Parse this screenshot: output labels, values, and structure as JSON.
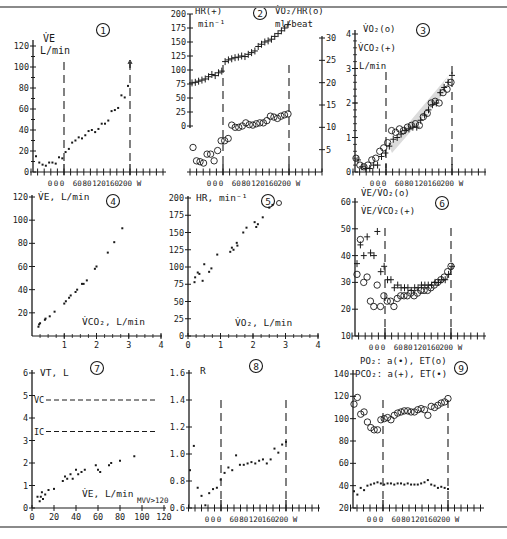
{
  "figure": {
    "caption_cropped": "Figure ... exercise test",
    "panel_count": 9
  },
  "chart_data": [
    {
      "id": 1,
      "type": "scatter",
      "title": "①",
      "ylabel": "V̇E",
      "yunit": "L/min",
      "xlabel": "W",
      "ylim": [
        0,
        120
      ],
      "yticks": [
        0,
        20,
        40,
        60,
        80,
        100,
        120
      ],
      "xtick_labels": [
        "0",
        "0",
        "0",
        "60",
        "80",
        "120",
        "160",
        "200",
        "W"
      ],
      "vlines": [
        "start_exercise",
        "end_exercise"
      ],
      "series": [
        {
          "name": "VE",
          "marker": "dot",
          "values": [
            15,
            9,
            7,
            6,
            9,
            9,
            8,
            14,
            13,
            19,
            22,
            28,
            30,
            33,
            32,
            35,
            39,
            40,
            38,
            41,
            46,
            46,
            49,
            58,
            59,
            61,
            73,
            71,
            82
          ]
        }
      ]
    },
    {
      "id": 2,
      "type": "scatter",
      "title": "②",
      "ylabel_left": "HR(+)",
      "yunit_left": "min⁻¹",
      "ylabel_right": "V̇O₂/HR(o)",
      "yunit_right": "ml/beat",
      "ylim_left": [
        0,
        200
      ],
      "yticks_left": [
        0,
        25,
        50,
        75,
        100,
        125,
        150,
        175,
        200
      ],
      "ylim_right": [
        0,
        30
      ],
      "yticks_right": [
        5,
        10,
        15,
        20,
        25,
        30
      ],
      "xtick_labels": [
        "0",
        "0",
        "0",
        "60",
        "80",
        "120",
        "160",
        "200",
        "W"
      ],
      "series": [
        {
          "name": "HR",
          "marker": "+",
          "values": [
            77,
            78,
            80,
            82,
            84,
            88,
            92,
            90,
            95,
            98,
            115,
            118,
            120,
            122,
            123,
            125,
            124,
            128,
            131,
            134,
            142,
            146,
            150,
            152,
            155,
            160,
            165,
            170,
            175,
            181
          ]
        },
        {
          "name": "VO2/HR",
          "marker": "o",
          "values": [
            5.5,
            2.5,
            2.3,
            2,
            4,
            4,
            2.5,
            4.8,
            7,
            7,
            7.5,
            10.5,
            10,
            10,
            10.3,
            11,
            10.6,
            10.5,
            10.8,
            11,
            11,
            11.5,
            12.5,
            12.3,
            12,
            12.5,
            12.8,
            13
          ]
        }
      ]
    },
    {
      "id": 3,
      "type": "scatter",
      "title": "③",
      "ylabel": "V̇O₂(o) V̇CO₂(+)",
      "yunit": "L/min",
      "ylim": [
        0,
        4
      ],
      "yticks": [
        0,
        1,
        2,
        3,
        4
      ],
      "xtick_labels": [
        "0",
        "0",
        "0",
        "60",
        "80",
        "120",
        "160",
        "200",
        "W"
      ],
      "shaded_band": true,
      "series": [
        {
          "name": "VO2",
          "marker": "o",
          "values": [
            0.4,
            0.2,
            0.15,
            0.2,
            0.35,
            0.4,
            0.6,
            0.7,
            0.85,
            1.2,
            1.15,
            1.25,
            1.2,
            1.3,
            1.35,
            1.4,
            1.35,
            1.6,
            1.7,
            2.0,
            2.05,
            2.0,
            2.3,
            2.4,
            2.6
          ]
        },
        {
          "name": "VCO2",
          "marker": "+",
          "values": [
            0.35,
            0.15,
            0.1,
            0.1,
            0.2,
            0.2,
            0.45,
            0.55,
            0.75,
            0.95,
            1.0,
            1.1,
            1.2,
            1.25,
            1.3,
            1.3,
            1.5,
            1.65,
            1.8,
            1.95,
            2.0,
            2.3,
            2.45,
            2.6,
            2.8
          ]
        }
      ]
    },
    {
      "id": 4,
      "type": "scatter",
      "title": "④",
      "ylabel": "V̇E, L/min",
      "xlabel": "V̇CO₂, L/min",
      "ylim": [
        0,
        120
      ],
      "yticks": [
        20,
        40,
        60,
        80,
        100,
        120
      ],
      "xlim": [
        0,
        4
      ],
      "xticks": [
        1,
        2,
        3,
        4
      ],
      "series": [
        {
          "name": "VE vs VCO2",
          "marker": "dot",
          "x": [
            0.2,
            0.22,
            0.25,
            0.4,
            0.42,
            0.55,
            0.7,
            1.0,
            1.05,
            1.15,
            1.2,
            1.35,
            1.4,
            1.55,
            1.6,
            1.7,
            1.95,
            2.0,
            2.35,
            2.55,
            2.8
          ],
          "y": [
            8,
            10,
            11,
            14,
            15,
            17,
            21,
            28,
            30,
            33,
            35,
            38,
            40,
            45,
            45,
            48,
            58,
            60,
            72,
            81,
            93
          ]
        }
      ]
    },
    {
      "id": 5,
      "type": "scatter",
      "title": "⑤",
      "ylabel": "HR, min⁻¹",
      "xlabel": "V̇O₂, L/min",
      "ylim": [
        0,
        200
      ],
      "yticks": [
        0,
        25,
        50,
        75,
        100,
        125,
        150,
        175,
        200
      ],
      "xlim": [
        0,
        4
      ],
      "xticks": [
        0,
        1,
        2,
        3,
        4
      ],
      "series": [
        {
          "name": "HR vs VO2",
          "marker": "dot",
          "x": [
            0.2,
            0.22,
            0.3,
            0.35,
            0.45,
            0.5,
            0.65,
            0.72,
            0.9,
            1.3,
            1.35,
            1.4,
            1.5,
            1.52,
            1.7,
            1.8,
            2.05,
            2.1,
            2.15,
            2.3,
            2.5,
            2.6
          ],
          "y": [
            78,
            85,
            92,
            90,
            80,
            104,
            93,
            98,
            118,
            122,
            128,
            125,
            135,
            131,
            150,
            157,
            165,
            158,
            162,
            172,
            186,
            190
          ]
        }
      ]
    },
    {
      "id": 6,
      "type": "scatter",
      "title": "⑥",
      "ylabel": "V̇E/V̇O₂(o) V̇E/V̇CO₂(+)",
      "ylim": [
        10,
        60
      ],
      "yticks": [
        10,
        20,
        30,
        40,
        50,
        60
      ],
      "xtick_labels": [
        "0",
        "0",
        "0",
        "60",
        "80",
        "120",
        "160",
        "200",
        "W"
      ],
      "series": [
        {
          "name": "VE/VO2",
          "marker": "o",
          "values": [
            33,
            46,
            30,
            32,
            23,
            21,
            29,
            21,
            25,
            23,
            23,
            21,
            24,
            25,
            25,
            25,
            26,
            25,
            26,
            27,
            27,
            27,
            28,
            29,
            30,
            31,
            32,
            34,
            36
          ]
        },
        {
          "name": "VE/VCO2",
          "marker": "+",
          "values": [
            37,
            44,
            40,
            47,
            41,
            40,
            49,
            34,
            36,
            31,
            31,
            28,
            29,
            28,
            28,
            28,
            27,
            28,
            28,
            29,
            29,
            29,
            29,
            30,
            30,
            31,
            31,
            33,
            36
          ]
        }
      ]
    },
    {
      "id": 7,
      "type": "scatter",
      "title": "⑦",
      "ylabel": "VT, L",
      "xlabel": "V̇E, L/min",
      "annotation": "MVV>120",
      "ylim": [
        0,
        6
      ],
      "yticks": [
        0,
        1,
        2,
        3,
        4,
        5,
        6
      ],
      "xlim": [
        0,
        120
      ],
      "xticks": [
        0,
        20,
        40,
        60,
        80,
        100,
        120
      ],
      "hlines": [
        {
          "label": "VC",
          "y": 4.8
        },
        {
          "label": "IC",
          "y": 3.4
        }
      ],
      "series": [
        {
          "name": "VT vs VE",
          "marker": "dot",
          "x": [
            5,
            7,
            8,
            9,
            10,
            12,
            15,
            20,
            28,
            30,
            32,
            35,
            37,
            40,
            42,
            45,
            48,
            58,
            60,
            62,
            70,
            72,
            80,
            93
          ],
          "y": [
            0.5,
            0.3,
            0.5,
            0.7,
            0.4,
            0.6,
            0.8,
            0.85,
            1.2,
            1.4,
            1.3,
            1.5,
            1.3,
            1.7,
            1.5,
            1.6,
            1.7,
            1.9,
            1.7,
            1.6,
            1.9,
            2.0,
            2.1,
            2.3
          ]
        }
      ]
    },
    {
      "id": 8,
      "type": "scatter",
      "title": "⑧",
      "ylabel": "R",
      "ylim": [
        0.6,
        1.6
      ],
      "yticks": [
        0.6,
        0.8,
        1.0,
        1.2,
        1.4,
        1.6
      ],
      "xtick_labels": [
        "0",
        "0",
        "0",
        "60",
        "80",
        "120",
        "160",
        "200",
        "W"
      ],
      "series": [
        {
          "name": "R",
          "marker": "dot",
          "values": [
            0.88,
            1.06,
            0.75,
            0.69,
            0.62,
            0.71,
            0.74,
            0.75,
            0.81,
            0.86,
            0.9,
            0.88,
            0.99,
            0.92,
            0.92,
            0.93,
            0.94,
            0.93,
            0.95,
            0.96,
            0.93,
            0.96,
            1.04,
            1.01,
            1.07,
            1.09
          ]
        }
      ]
    },
    {
      "id": 9,
      "type": "scatter",
      "title": "⑨",
      "ylabel": "PO₂: a(•), ET(o)  PCO₂: a(+), ET(•)",
      "ylim": [
        20,
        140
      ],
      "yticks": [
        20,
        40,
        60,
        80,
        100,
        120,
        140
      ],
      "xtick_labels": [
        "0",
        "0",
        "0",
        "60",
        "80",
        "120",
        "160",
        "200",
        "W"
      ],
      "series": [
        {
          "name": "PETO2",
          "marker": "o",
          "values": [
            113,
            119,
            104,
            106,
            97,
            92,
            90,
            90,
            99,
            100,
            101,
            99,
            103,
            105,
            106,
            107,
            107,
            106,
            106,
            108,
            109,
            108,
            103,
            111,
            110,
            112,
            114,
            115,
            118
          ]
        },
        {
          "name": "PETCO2",
          "marker": "dot",
          "values": [
            35,
            32,
            38,
            36,
            40,
            41,
            42,
            43,
            42,
            41,
            42,
            42,
            41,
            42,
            42,
            41,
            42,
            41,
            41,
            41,
            42,
            43,
            45,
            41,
            40,
            38,
            39,
            38,
            37
          ]
        }
      ]
    }
  ],
  "panels": {
    "p1": {
      "num": "1",
      "ylabel": "V̇E",
      "yunit": "L/min"
    },
    "p2": {
      "num": "2",
      "ylabel_left": "HR(+)",
      "yunit_left": "min⁻¹",
      "ylabel_right": "V̇O₂/HR(o)",
      "yunit_right": "ml/beat"
    },
    "p3": {
      "num": "3",
      "ylabel1": "V̇O₂(o)",
      "ylabel2": "V̇CO₂(+)",
      "yunit": "L/min"
    },
    "p4": {
      "num": "4",
      "ylabel": "V̇E, L/min",
      "xlabel": "V̇CO₂, L/min"
    },
    "p5": {
      "num": "5",
      "ylabel": "HR, min⁻¹",
      "xlabel": "V̇O₂, L/min"
    },
    "p6": {
      "num": "6",
      "ylabel1": "V̇E/V̇O₂(o)",
      "ylabel2": "V̇E/V̇CO₂(+)"
    },
    "p7": {
      "num": "7",
      "ylabel": "VT, L",
      "xlabel": "V̇E, L/min",
      "annotation": "MVV>120",
      "vc": "VC",
      "ic": "IC"
    },
    "p8": {
      "num": "8",
      "ylabel": "R"
    },
    "p9": {
      "num": "9",
      "ylabel1": "PO₂: a(•), ET(o)",
      "ylabel2": "PCO₂: a(+), ET(•)"
    },
    "work_axis_labels": "0 0 0  60 80 120 160 200 W"
  }
}
